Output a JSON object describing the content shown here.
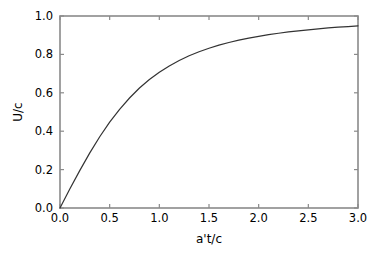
{
  "figure": {
    "background_color": "#ffffff",
    "frame_color": "#8a8a8a",
    "line_color": "#333333"
  },
  "chart_data": {
    "type": "line",
    "title": "",
    "xlabel": "a't/c",
    "ylabel": "U/c",
    "xlim": [
      0.0,
      3.0
    ],
    "ylim": [
      0.0,
      1.0
    ],
    "grid": false,
    "legend": false,
    "legend_position": "none",
    "xticks": [
      0.0,
      0.5,
      1.0,
      1.5,
      2.0,
      2.5,
      3.0
    ],
    "xticklabels": [
      "0.0",
      "0.5",
      "1.0",
      "1.5",
      "2.0",
      "2.5",
      "3.0"
    ],
    "yticks": [
      0.0,
      0.2,
      0.4,
      0.6,
      0.8,
      1.0
    ],
    "yticklabels": [
      "0.0",
      "0.2",
      "0.4",
      "0.6",
      "0.8",
      "1.0"
    ],
    "series": [
      {
        "name": "U/c",
        "color": "#333333",
        "x": [
          0.0,
          0.1,
          0.2,
          0.3,
          0.4,
          0.5,
          0.6,
          0.7,
          0.8,
          0.9,
          1.0,
          1.1,
          1.2,
          1.3,
          1.4,
          1.5,
          1.6,
          1.7,
          1.8,
          1.9,
          2.0,
          2.1,
          2.2,
          2.3,
          2.4,
          2.5,
          2.6,
          2.7,
          2.8,
          2.9,
          3.0
        ],
        "values": [
          0.0,
          0.1,
          0.196,
          0.287,
          0.371,
          0.447,
          0.514,
          0.573,
          0.625,
          0.669,
          0.707,
          0.74,
          0.768,
          0.793,
          0.814,
          0.832,
          0.848,
          0.862,
          0.874,
          0.885,
          0.894,
          0.903,
          0.91,
          0.917,
          0.923,
          0.928,
          0.933,
          0.938,
          0.942,
          0.945,
          0.949
        ]
      }
    ]
  }
}
